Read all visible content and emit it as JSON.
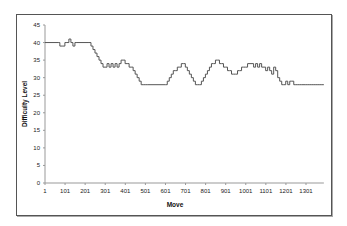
{
  "chart_data": {
    "type": "line",
    "title": "",
    "xlabel": "Move",
    "ylabel": "Difficulty Level",
    "xlim": [
      1,
      1390
    ],
    "ylim": [
      0,
      45
    ],
    "x_ticks": [
      "1",
      "101",
      "201",
      "301",
      "401",
      "501",
      "601",
      "701",
      "801",
      "901",
      "1001",
      "1101",
      "1201",
      "1301"
    ],
    "y_ticks": [
      "0",
      "5",
      "10",
      "15",
      "20",
      "25",
      "30",
      "35",
      "40",
      "45"
    ],
    "grid": false,
    "legend": null,
    "series": [
      {
        "name": "Difficulty Level",
        "color": "#555555",
        "x": [
          1,
          70,
          75,
          90,
          100,
          110,
          120,
          130,
          140,
          150,
          160,
          220,
          230,
          240,
          250,
          260,
          270,
          280,
          290,
          300,
          310,
          320,
          330,
          340,
          350,
          360,
          370,
          380,
          390,
          400,
          410,
          420,
          430,
          440,
          450,
          460,
          470,
          480,
          490,
          500,
          510,
          600,
          610,
          620,
          630,
          640,
          650,
          660,
          670,
          680,
          690,
          700,
          710,
          720,
          730,
          740,
          750,
          760,
          770,
          780,
          790,
          800,
          810,
          820,
          830,
          840,
          850,
          860,
          870,
          880,
          890,
          900,
          910,
          920,
          930,
          940,
          950,
          960,
          970,
          980,
          990,
          1000,
          1010,
          1040,
          1050,
          1060,
          1070,
          1080,
          1100,
          1110,
          1120,
          1130,
          1140,
          1150,
          1160,
          1170,
          1180,
          1190,
          1200,
          1210,
          1220,
          1230,
          1240,
          1250,
          1260,
          1270,
          1280,
          1300,
          1310,
          1320,
          1330,
          1340,
          1350,
          1360,
          1370,
          1380,
          1390
        ],
        "values": [
          40,
          40,
          39,
          39,
          40,
          40,
          41,
          40,
          39,
          40,
          40,
          40,
          39,
          38,
          37,
          36,
          35,
          34,
          33,
          33,
          34,
          33,
          34,
          33,
          34,
          33,
          34,
          35,
          35,
          34,
          34,
          33,
          33,
          32,
          31,
          30,
          29,
          28,
          28,
          28,
          28,
          28,
          29,
          30,
          31,
          32,
          32,
          33,
          33,
          34,
          34,
          33,
          32,
          31,
          30,
          29,
          28,
          28,
          28,
          29,
          30,
          31,
          32,
          33,
          34,
          34,
          35,
          35,
          34,
          34,
          33,
          33,
          32,
          32,
          31,
          31,
          31,
          32,
          32,
          33,
          33,
          33,
          34,
          33,
          34,
          33,
          34,
          33,
          32,
          33,
          32,
          31,
          33,
          32,
          30,
          29,
          28,
          28,
          29,
          28,
          29,
          29,
          28,
          28,
          28,
          28,
          28,
          28,
          28,
          28,
          28,
          28,
          28,
          28,
          28,
          28,
          28
        ]
      }
    ]
  }
}
